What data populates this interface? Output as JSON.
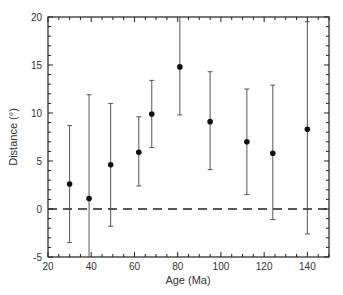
{
  "chart_data": {
    "type": "scatter",
    "title": "",
    "xlabel": "Age (Ma)",
    "ylabel": "Distance (°)",
    "xlim": [
      20,
      150
    ],
    "ylim": [
      -5,
      20
    ],
    "xticks": [
      20,
      40,
      60,
      80,
      100,
      120,
      140
    ],
    "yticks": [
      -5,
      0,
      5,
      10,
      15,
      20
    ],
    "x_minor_step": 5,
    "y_minor_step": 1,
    "grid": false,
    "legend": null,
    "reference_line": {
      "y": 0,
      "style": "dashed"
    },
    "series": [
      {
        "name": "Distance",
        "points": [
          {
            "x": 30,
            "y": 2.6,
            "err_low": -3.5,
            "err_high": 8.7
          },
          {
            "x": 39,
            "y": 1.1,
            "err_low": -5.0,
            "err_high": 11.9
          },
          {
            "x": 49,
            "y": 4.6,
            "err_low": -1.8,
            "err_high": 11.0
          },
          {
            "x": 62,
            "y": 5.9,
            "err_low": 2.4,
            "err_high": 9.6
          },
          {
            "x": 68,
            "y": 9.9,
            "err_low": 6.4,
            "err_high": 13.4
          },
          {
            "x": 81,
            "y": 14.8,
            "err_low": 9.8,
            "err_high": 20.0
          },
          {
            "x": 95,
            "y": 9.1,
            "err_low": 4.1,
            "err_high": 14.3
          },
          {
            "x": 112,
            "y": 7.0,
            "err_low": 1.5,
            "err_high": 12.5
          },
          {
            "x": 124,
            "y": 5.8,
            "err_low": -1.1,
            "err_high": 12.9
          },
          {
            "x": 140,
            "y": 8.3,
            "err_low": -2.6,
            "err_high": 19.5
          }
        ]
      }
    ]
  }
}
